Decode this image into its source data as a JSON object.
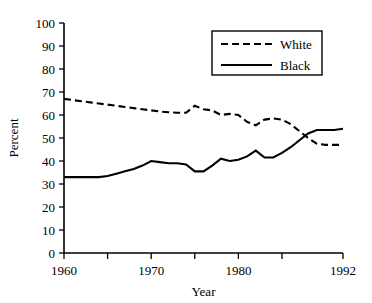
{
  "chart_data": {
    "type": "line",
    "title": "",
    "xlabel": "Year",
    "ylabel": "Percent",
    "xlim": [
      1960,
      1992
    ],
    "ylim": [
      0,
      100
    ],
    "grid": false,
    "legend_position": "top-right",
    "ytick_labels": [
      "0",
      "10",
      "20",
      "30",
      "40",
      "50",
      "60",
      "70",
      "80",
      "90",
      "100"
    ],
    "yticks": [
      0,
      10,
      20,
      30,
      40,
      50,
      60,
      70,
      80,
      90,
      100
    ],
    "xticks": [
      1960,
      1965,
      1970,
      1975,
      1980,
      1985,
      1992
    ],
    "xtick_labels": [
      "1960",
      "",
      "1970",
      "",
      "1980",
      "",
      "1992"
    ],
    "x": [
      1960,
      1961,
      1962,
      1963,
      1964,
      1965,
      1966,
      1967,
      1968,
      1969,
      1970,
      1971,
      1972,
      1973,
      1974,
      1975,
      1976,
      1977,
      1978,
      1979,
      1980,
      1981,
      1982,
      1983,
      1984,
      1985,
      1986,
      1987,
      1988,
      1989,
      1990,
      1991,
      1992
    ],
    "series": [
      {
        "name": "White",
        "style": "dashed",
        "color": "#000000",
        "values": [
          67,
          66.5,
          66,
          65.5,
          65,
          64.5,
          64,
          63.5,
          63,
          62.5,
          62,
          61.5,
          61.2,
          61,
          61,
          64,
          62.5,
          62,
          60,
          60.5,
          60,
          57,
          55.5,
          58,
          58.5,
          58,
          56,
          53,
          50,
          47.5,
          47,
          47,
          47
        ]
      },
      {
        "name": "Black",
        "style": "solid",
        "color": "#000000",
        "values": [
          33,
          33,
          33,
          33,
          33,
          33.5,
          34.5,
          35.5,
          36.5,
          38,
          40,
          39.5,
          39,
          39,
          38.5,
          35.5,
          35.5,
          38,
          41,
          40,
          40.5,
          42,
          44.5,
          41.5,
          41.5,
          43.5,
          46,
          49,
          52,
          53.5,
          53.5,
          53.5,
          54
        ]
      }
    ]
  },
  "legend": {
    "entries": [
      {
        "label": "White",
        "style": "dashed"
      },
      {
        "label": "Black",
        "style": "solid"
      }
    ]
  },
  "axes": {
    "y_axis_title": "Percent",
    "x_axis_title": "Year"
  }
}
